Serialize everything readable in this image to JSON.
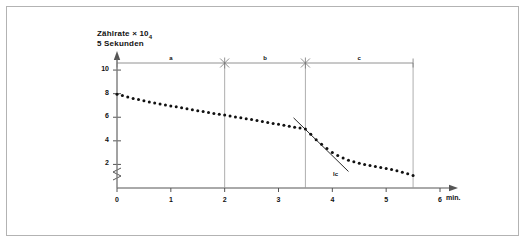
{
  "figure": {
    "background_color": "#ffffff",
    "border_color": "#b3b3b3"
  },
  "axis_title": {
    "line1_prefix": "Zählrate × 10",
    "line1_subscript": "4",
    "line2": "5 Sekunden"
  },
  "annotations": {
    "tangent_label": "lc"
  },
  "chart_data": {
    "type": "scatter",
    "xlabel": "min.",
    "ylabel": "Zählrate × 10₄ / 5 Sekunden",
    "xlim": [
      0,
      6
    ],
    "ylim": [
      0,
      10.6
    ],
    "grid": false,
    "legend": false,
    "axis_break_y": true,
    "xticks": [
      0,
      1,
      2,
      3,
      4,
      5,
      6
    ],
    "xticklabels": [
      "0",
      "1",
      "2",
      "3",
      "4",
      "5",
      "6"
    ],
    "yticks": [
      2,
      4,
      6,
      8,
      10
    ],
    "yticklabels": [
      "2",
      "4",
      "6",
      "8",
      "10"
    ],
    "series": [
      {
        "name": "Zählrate",
        "marker": "dot",
        "color": "#111111",
        "x": [
          0.0,
          0.1,
          0.2,
          0.3,
          0.4,
          0.5,
          0.6,
          0.7,
          0.8,
          0.9,
          1.0,
          1.1,
          1.2,
          1.3,
          1.4,
          1.5,
          1.6,
          1.7,
          1.8,
          1.9,
          2.0,
          2.1,
          2.2,
          2.3,
          2.4,
          2.5,
          2.6,
          2.7,
          2.8,
          2.9,
          3.0,
          3.1,
          3.2,
          3.3,
          3.4,
          3.5,
          3.6,
          3.7,
          3.8,
          3.9,
          4.0,
          4.1,
          4.2,
          4.3,
          4.4,
          4.5,
          4.6,
          4.7,
          4.8,
          4.9,
          5.0,
          5.1,
          5.2,
          5.3,
          5.4,
          5.5
        ],
        "y": [
          7.95,
          7.85,
          7.72,
          7.6,
          7.5,
          7.4,
          7.3,
          7.2,
          7.12,
          7.04,
          6.96,
          6.88,
          6.8,
          6.72,
          6.64,
          6.56,
          6.48,
          6.4,
          6.32,
          6.25,
          6.18,
          6.1,
          6.02,
          5.95,
          5.88,
          5.8,
          5.72,
          5.64,
          5.56,
          5.48,
          5.4,
          5.32,
          5.24,
          5.16,
          5.08,
          5.0,
          4.55,
          4.1,
          3.7,
          3.35,
          3.02,
          2.76,
          2.54,
          2.36,
          2.22,
          2.1,
          2.0,
          1.9,
          1.82,
          1.74,
          1.66,
          1.56,
          1.46,
          1.34,
          1.2,
          1.05
        ]
      }
    ],
    "tangent_line": {
      "label": "lc",
      "x": [
        3.28,
        4.3
      ],
      "y": [
        5.95,
        1.4
      ],
      "color": "#111111"
    },
    "intervals": [
      {
        "label": "a",
        "start": 0.0,
        "end": 2.0
      },
      {
        "label": "b",
        "start": 2.0,
        "end": 3.5
      },
      {
        "label": "c",
        "start": 3.5,
        "end": 5.5
      }
    ],
    "interval_dividers": [
      0.0,
      2.0,
      3.5,
      5.5
    ]
  }
}
